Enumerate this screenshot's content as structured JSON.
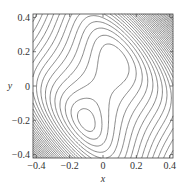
{
  "chart_data": {
    "type": "contour",
    "title": "",
    "xlabel": "x",
    "ylabel": "y",
    "xlim": [
      -0.42,
      0.42
    ],
    "ylim": [
      -0.42,
      0.42
    ],
    "xticks": [
      "-0.4",
      "-0.2",
      "0",
      "0.2",
      "0.4"
    ],
    "yticks": [
      "-0.4",
      "-0.2",
      "0",
      "0.2",
      "0.4"
    ],
    "grid": false,
    "legend": null,
    "features": {
      "saddle": [
        0.03,
        0.08
      ],
      "minimum": [
        -0.13,
        -0.22
      ]
    },
    "line_color": "#555555"
  }
}
